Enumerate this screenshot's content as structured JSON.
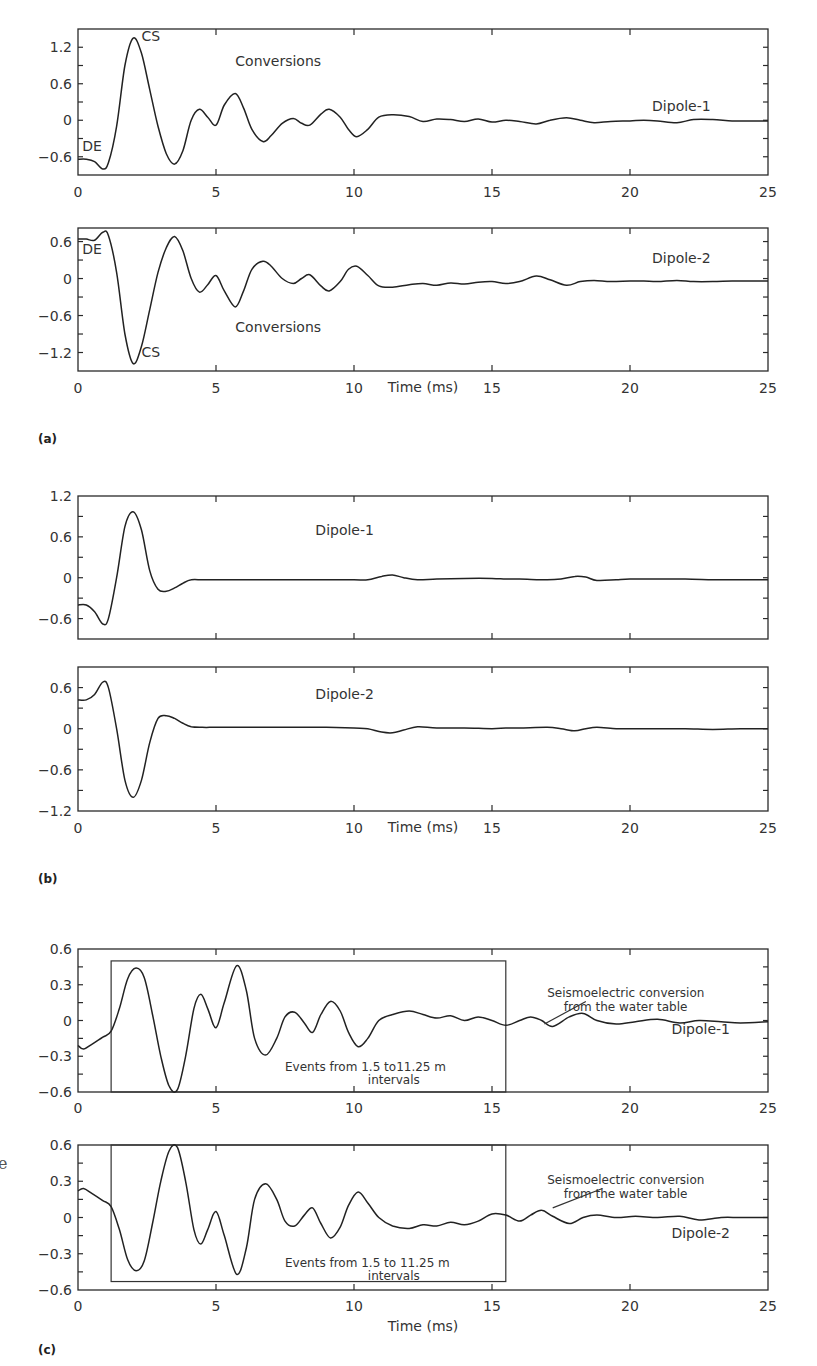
{
  "figure": {
    "x_axis_label": "Time (ms)",
    "x_ticks": [
      0,
      5,
      10,
      15,
      20,
      25
    ],
    "panel_labels": [
      "(a)",
      "(b)",
      "(c)"
    ],
    "stray_glyph": "e"
  },
  "chart_data": [
    {
      "id": "a1",
      "panel": "(a)",
      "type": "line",
      "title": "",
      "xlabel": "",
      "ylabel": "",
      "xlim": [
        0,
        25
      ],
      "ylim": [
        -0.9,
        1.5
      ],
      "yticks": [
        1.2,
        0.6,
        0,
        -0.6
      ],
      "ytick_labels": [
        "1.2",
        "0.6",
        "0",
        "−0.6"
      ],
      "grid": false,
      "series": [
        {
          "name": "Dipole-1",
          "x": [
            0,
            0.3,
            0.6,
            0.9,
            1.1,
            1.4,
            1.7,
            2.0,
            2.3,
            2.6,
            2.9,
            3.2,
            3.5,
            3.8,
            4.1,
            4.4,
            4.7,
            5.0,
            5.3,
            5.7,
            6.0,
            6.3,
            6.7,
            7.0,
            7.4,
            7.8,
            8.1,
            8.4,
            8.8,
            9.1,
            9.5,
            9.8,
            10.1,
            10.5,
            10.9,
            11.4,
            12.0,
            12.5,
            13.0,
            13.5,
            14.0,
            14.5,
            15.0,
            15.5,
            16.0,
            16.6,
            17.1,
            17.7,
            18.2,
            18.7,
            19.3,
            20.0,
            20.5,
            21.0,
            21.7,
            22.3,
            23.0,
            23.7,
            24.3,
            25
          ],
          "y": [
            -0.64,
            -0.64,
            -0.68,
            -0.8,
            -0.7,
            -0.1,
            0.9,
            1.35,
            1.1,
            0.5,
            -0.1,
            -0.55,
            -0.72,
            -0.5,
            0.0,
            0.18,
            0.05,
            -0.08,
            0.25,
            0.44,
            0.2,
            -0.15,
            -0.35,
            -0.25,
            -0.05,
            0.03,
            -0.05,
            -0.08,
            0.1,
            0.18,
            0.05,
            -0.15,
            -0.27,
            -0.15,
            0.05,
            0.09,
            0.06,
            -0.02,
            0.02,
            0.01,
            -0.02,
            0.02,
            -0.03,
            0.0,
            -0.02,
            -0.06,
            0.0,
            0.04,
            0.0,
            -0.04,
            -0.02,
            -0.01,
            0.0,
            -0.01,
            -0.04,
            0.01,
            0.01,
            -0.01,
            -0.01,
            -0.01
          ]
        }
      ],
      "annotations": [
        {
          "text": "CS",
          "x": 2.3,
          "y": 1.3
        },
        {
          "text": "DE",
          "x": 0.15,
          "y": -0.5
        },
        {
          "text": "Conversions",
          "x": 5.7,
          "y": 0.9
        },
        {
          "text": "Dipole-1",
          "x": 20.8,
          "y": 0.15
        }
      ]
    },
    {
      "id": "a2",
      "panel": "(a)",
      "type": "line",
      "title": "",
      "xlabel": "Time (ms)",
      "ylabel": "",
      "xlim": [
        0,
        25
      ],
      "ylim": [
        -1.5,
        0.82
      ],
      "yticks": [
        0.6,
        0,
        -0.6,
        -1.2
      ],
      "ytick_labels": [
        "0.6",
        "0",
        "−0.6",
        "−1.2"
      ],
      "grid": false,
      "series": [
        {
          "name": "Dipole-2",
          "x": [
            0,
            0.3,
            0.6,
            0.9,
            1.1,
            1.4,
            1.7,
            2.0,
            2.3,
            2.6,
            2.9,
            3.2,
            3.5,
            3.8,
            4.1,
            4.4,
            4.7,
            5.0,
            5.3,
            5.7,
            6.0,
            6.3,
            6.7,
            7.0,
            7.4,
            7.8,
            8.1,
            8.4,
            8.8,
            9.1,
            9.5,
            9.8,
            10.1,
            10.5,
            10.9,
            11.4,
            12.0,
            12.5,
            13.0,
            13.5,
            14.0,
            14.5,
            15.0,
            15.5,
            16.0,
            16.6,
            17.1,
            17.7,
            18.2,
            18.7,
            19.3,
            20.0,
            20.5,
            21.0,
            21.7,
            22.3,
            23.0,
            23.7,
            24.3,
            25
          ],
          "y": [
            0.64,
            0.64,
            0.62,
            0.75,
            0.7,
            0.1,
            -0.9,
            -1.38,
            -1.1,
            -0.5,
            0.1,
            0.5,
            0.68,
            0.45,
            0.0,
            -0.22,
            -0.1,
            0.05,
            -0.2,
            -0.46,
            -0.2,
            0.15,
            0.28,
            0.2,
            0.0,
            -0.08,
            0.0,
            0.06,
            -0.12,
            -0.2,
            -0.05,
            0.15,
            0.2,
            0.05,
            -0.12,
            -0.14,
            -0.1,
            -0.08,
            -0.11,
            -0.07,
            -0.09,
            -0.06,
            -0.05,
            -0.08,
            -0.05,
            0.04,
            -0.02,
            -0.11,
            -0.05,
            -0.03,
            -0.05,
            -0.04,
            -0.04,
            -0.05,
            -0.03,
            -0.05,
            -0.05,
            -0.04,
            -0.04,
            -0.04
          ]
        }
      ],
      "annotations": [
        {
          "text": "CS",
          "x": 2.3,
          "y": -1.28
        },
        {
          "text": "DE",
          "x": 0.15,
          "y": 0.4
        },
        {
          "text": "Conversions",
          "x": 5.7,
          "y": -0.87
        },
        {
          "text": "Dipole-2",
          "x": 20.8,
          "y": 0.26
        }
      ]
    },
    {
      "id": "b1",
      "panel": "(b)",
      "type": "line",
      "title": "",
      "xlabel": "",
      "ylabel": "",
      "xlim": [
        0,
        25
      ],
      "ylim": [
        -0.9,
        1.2
      ],
      "yticks": [
        1.2,
        0.6,
        0,
        -0.6
      ],
      "ytick_labels": [
        "1.2",
        "0.6",
        "0",
        "−0.6"
      ],
      "grid": false,
      "series": [
        {
          "name": "Dipole-1",
          "x": [
            0,
            0.3,
            0.6,
            0.9,
            1.1,
            1.4,
            1.7,
            2.0,
            2.3,
            2.6,
            2.9,
            3.2,
            3.5,
            3.8,
            4.1,
            4.5,
            5.0,
            6,
            7,
            8,
            9,
            10,
            10.5,
            11.0,
            11.4,
            11.8,
            12.3,
            13,
            14,
            15,
            15.5,
            16,
            17,
            17.5,
            18.0,
            18.4,
            18.8,
            19.5,
            20,
            21,
            22,
            23,
            24,
            25
          ],
          "y": [
            -0.4,
            -0.4,
            -0.5,
            -0.68,
            -0.6,
            0.0,
            0.75,
            0.97,
            0.7,
            0.1,
            -0.17,
            -0.2,
            -0.15,
            -0.08,
            -0.03,
            -0.03,
            -0.03,
            -0.03,
            -0.03,
            -0.03,
            -0.03,
            -0.03,
            -0.03,
            0.02,
            0.04,
            0.0,
            -0.03,
            -0.02,
            -0.01,
            -0.01,
            -0.02,
            -0.02,
            -0.03,
            -0.02,
            0.02,
            0.01,
            -0.04,
            -0.03,
            -0.02,
            -0.02,
            -0.02,
            -0.03,
            -0.03,
            -0.03
          ]
        }
      ],
      "annotations": [
        {
          "text": "Dipole-1",
          "x": 8.6,
          "y": 0.62
        }
      ]
    },
    {
      "id": "b2",
      "panel": "(b)",
      "type": "line",
      "title": "",
      "xlabel": "Time (ms)",
      "ylabel": "",
      "xlim": [
        0,
        25
      ],
      "ylim": [
        -1.2,
        0.9
      ],
      "yticks": [
        0.6,
        0,
        -0.6,
        -1.2
      ],
      "ytick_labels": [
        "0.6",
        "0",
        "−0.6",
        "−1.2"
      ],
      "grid": false,
      "series": [
        {
          "name": "Dipole-2",
          "x": [
            0,
            0.3,
            0.6,
            0.9,
            1.1,
            1.4,
            1.7,
            2.0,
            2.3,
            2.6,
            2.9,
            3.2,
            3.5,
            3.8,
            4.1,
            4.5,
            5.0,
            6,
            7,
            8,
            9,
            10,
            10.5,
            11.0,
            11.4,
            11.8,
            12.3,
            13,
            14,
            15,
            15.5,
            16,
            17,
            17.5,
            18.0,
            18.4,
            18.8,
            19.5,
            20,
            21,
            22,
            23,
            24,
            25
          ],
          "y": [
            0.42,
            0.42,
            0.5,
            0.68,
            0.6,
            0.0,
            -0.75,
            -1.0,
            -0.75,
            -0.2,
            0.15,
            0.19,
            0.15,
            0.08,
            0.03,
            0.02,
            0.02,
            0.02,
            0.02,
            0.02,
            0.02,
            0.01,
            0.0,
            -0.05,
            -0.06,
            -0.02,
            0.03,
            0.01,
            0.01,
            0.0,
            0.01,
            0.01,
            0.02,
            0.0,
            -0.03,
            0.0,
            0.02,
            0.0,
            0.0,
            0.0,
            0.0,
            -0.01,
            0.0,
            0.0
          ]
        }
      ],
      "annotations": [
        {
          "text": "Dipole-2",
          "x": 8.6,
          "y": 0.43
        }
      ]
    },
    {
      "id": "c1",
      "panel": "(c)",
      "type": "line",
      "title": "",
      "xlabel": "",
      "ylabel": "",
      "xlim": [
        0,
        25
      ],
      "ylim": [
        -0.6,
        0.6
      ],
      "yticks": [
        0.6,
        0.3,
        0,
        -0.3,
        -0.6
      ],
      "ytick_labels": [
        "0.6",
        "0.3",
        "0",
        "−0.3",
        "−0.6"
      ],
      "grid": false,
      "series": [
        {
          "name": "Dipole-1",
          "x": [
            0,
            0.2,
            0.5,
            0.9,
            1.2,
            1.5,
            1.8,
            2.1,
            2.4,
            2.7,
            3.0,
            3.3,
            3.6,
            3.9,
            4.2,
            4.45,
            4.7,
            5.0,
            5.3,
            5.75,
            6.1,
            6.4,
            6.8,
            7.2,
            7.5,
            7.85,
            8.2,
            8.5,
            8.8,
            9.15,
            9.5,
            9.8,
            10.15,
            10.5,
            10.9,
            11.4,
            12.0,
            12.5,
            13.0,
            13.5,
            14.0,
            14.5,
            15.0,
            15.5,
            16.0,
            16.4,
            16.8,
            17.2,
            17.8,
            18.3,
            18.8,
            19.5,
            20.2,
            21.0,
            21.8,
            22.5,
            23.3,
            24.0,
            25
          ],
          "y": [
            -0.21,
            -0.24,
            -0.2,
            -0.14,
            -0.09,
            0.1,
            0.35,
            0.44,
            0.36,
            0.05,
            -0.3,
            -0.55,
            -0.58,
            -0.3,
            0.1,
            0.22,
            0.1,
            -0.06,
            0.15,
            0.46,
            0.25,
            -0.15,
            -0.29,
            -0.15,
            0.03,
            0.07,
            -0.02,
            -0.1,
            0.05,
            0.16,
            0.08,
            -0.1,
            -0.22,
            -0.15,
            0.0,
            0.05,
            0.08,
            0.05,
            0.02,
            0.04,
            0.0,
            0.03,
            0.0,
            -0.04,
            0.0,
            0.03,
            0.0,
            -0.05,
            0.03,
            0.06,
            0.0,
            -0.03,
            -0.01,
            0.01,
            -0.02,
            0.0,
            -0.01,
            -0.02,
            -0.01
          ]
        }
      ],
      "annotations": [
        {
          "text": "Dipole-1",
          "x": 21.5,
          "y": -0.11
        },
        {
          "text": "Events from 1.5 to11.25 m",
          "x": 7.5,
          "y": -0.42
        },
        {
          "text": "intervals",
          "x": 10.5,
          "y": -0.53
        },
        {
          "text": "Seismoelectric conversion",
          "x": 17.0,
          "y": 0.2
        },
        {
          "text": "from the water table",
          "x": 17.6,
          "y": 0.08
        }
      ],
      "boxes": [
        {
          "x0": 1.2,
          "x1": 15.5,
          "y0": -0.6,
          "y1": 0.5
        }
      ],
      "leader": {
        "x0": 16.9,
        "y0": -0.03,
        "x1": 18.4,
        "y1": 0.16
      }
    },
    {
      "id": "c2",
      "panel": "(c)",
      "type": "line",
      "title": "",
      "xlabel": "Time (ms)",
      "ylabel": "",
      "xlim": [
        0,
        25
      ],
      "ylim": [
        -0.6,
        0.6
      ],
      "yticks": [
        0.6,
        0.3,
        0,
        -0.3,
        -0.6
      ],
      "ytick_labels": [
        "0.6",
        "0.3",
        "0",
        "−0.3",
        "−0.6"
      ],
      "grid": false,
      "series": [
        {
          "name": "Dipole-2",
          "x": [
            0,
            0.2,
            0.5,
            0.9,
            1.2,
            1.5,
            1.8,
            2.1,
            2.4,
            2.7,
            3.0,
            3.3,
            3.6,
            3.9,
            4.2,
            4.45,
            4.7,
            5.0,
            5.3,
            5.75,
            6.1,
            6.4,
            6.8,
            7.2,
            7.5,
            7.85,
            8.2,
            8.5,
            8.8,
            9.15,
            9.5,
            9.8,
            10.15,
            10.5,
            10.9,
            11.4,
            12.0,
            12.5,
            13.0,
            13.5,
            14.0,
            14.5,
            15.0,
            15.5,
            16.0,
            16.4,
            16.8,
            17.2,
            17.8,
            18.3,
            18.8,
            19.5,
            20.2,
            21.0,
            21.8,
            22.5,
            23.3,
            24.0,
            25
          ],
          "y": [
            0.22,
            0.24,
            0.2,
            0.14,
            0.09,
            -0.1,
            -0.35,
            -0.44,
            -0.36,
            -0.05,
            0.3,
            0.55,
            0.58,
            0.3,
            -0.1,
            -0.22,
            -0.1,
            0.05,
            -0.15,
            -0.47,
            -0.25,
            0.15,
            0.28,
            0.15,
            -0.03,
            -0.07,
            0.02,
            0.08,
            -0.05,
            -0.17,
            -0.08,
            0.1,
            0.21,
            0.12,
            0.0,
            -0.07,
            -0.09,
            -0.06,
            -0.07,
            -0.04,
            -0.06,
            -0.03,
            0.03,
            0.02,
            -0.03,
            0.02,
            0.06,
            0.01,
            -0.05,
            0.0,
            0.02,
            0.0,
            0.01,
            0.0,
            0.01,
            -0.02,
            0.0,
            0.0,
            0.0
          ]
        }
      ],
      "annotations": [
        {
          "text": "Dipole-2",
          "x": 21.5,
          "y": -0.17
        },
        {
          "text": "Events from 1.5 to 11.25 m",
          "x": 7.5,
          "y": -0.41
        },
        {
          "text": "intervals",
          "x": 10.5,
          "y": -0.52
        },
        {
          "text": "Seismoelectric conversion",
          "x": 17.0,
          "y": 0.28
        },
        {
          "text": "from the water table",
          "x": 17.6,
          "y": 0.16
        }
      ],
      "boxes": [
        {
          "x0": 1.2,
          "x1": 15.5,
          "y0": -0.53,
          "y1": 0.6
        }
      ],
      "leader": {
        "x0": 17.2,
        "y0": 0.08,
        "x1": 19.0,
        "y1": 0.24
      }
    }
  ]
}
